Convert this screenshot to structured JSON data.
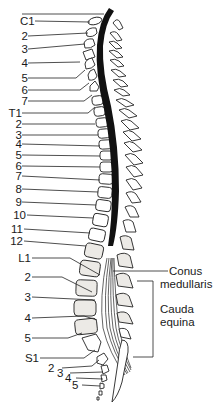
{
  "figure": {
    "vertebra_labels": [
      {
        "text": "C1",
        "y": 21
      },
      {
        "text": "2",
        "y": 36
      },
      {
        "text": "3",
        "y": 49
      },
      {
        "text": "4",
        "y": 63
      },
      {
        "text": "5",
        "y": 78
      },
      {
        "text": "6",
        "y": 90
      },
      {
        "text": "7",
        "y": 101
      },
      {
        "text": "T1",
        "y": 113
      },
      {
        "text": "2",
        "y": 124
      },
      {
        "text": "3",
        "y": 135
      },
      {
        "text": "4",
        "y": 144
      },
      {
        "text": "5",
        "y": 155
      },
      {
        "text": "6",
        "y": 166
      },
      {
        "text": "7",
        "y": 176
      },
      {
        "text": "8",
        "y": 189
      },
      {
        "text": "9",
        "y": 202
      },
      {
        "text": "10",
        "y": 215
      },
      {
        "text": "11",
        "y": 229
      },
      {
        "text": "12",
        "y": 241
      },
      {
        "text": "L1",
        "y": 258
      },
      {
        "text": "2",
        "y": 277
      },
      {
        "text": "3",
        "y": 297
      },
      {
        "text": "4",
        "y": 318
      },
      {
        "text": "5",
        "y": 338
      },
      {
        "text": "S1",
        "y": 358
      },
      {
        "text": "2",
        "y": 368
      },
      {
        "text": "3",
        "y": 373
      },
      {
        "text": "4",
        "y": 378
      },
      {
        "text": "5",
        "y": 385
      }
    ],
    "annotations": {
      "conus_line1": "Conus",
      "conus_line2": "medullaris",
      "cauda_line1": "Cauda",
      "cauda_line2": "equina"
    },
    "colors": {
      "ink": "#222222",
      "cord": "#111111",
      "stipple": "#eceae6",
      "background": "#ffffff"
    }
  }
}
